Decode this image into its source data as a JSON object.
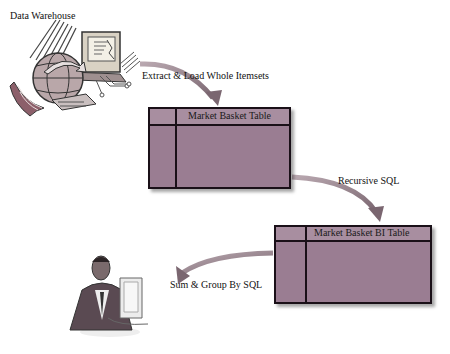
{
  "labels": {
    "data_warehouse": "Data Warehouse",
    "extract_load": "Extract & Load Whole Itemsets",
    "recursive_sql": "Recursive SQL",
    "sum_group": "Sum & Group By SQL"
  },
  "tables": [
    {
      "title": "Market Basket Table"
    },
    {
      "title": "Market Basket  BI Table"
    }
  ],
  "icons": {
    "warehouse": "data-warehouse-globe-computer-icon",
    "user": "business-user-at-computer-icon"
  },
  "colors": {
    "table_fill": "#9a7d92",
    "table_border": "#1a1018",
    "arrow": "#8a7a80"
  }
}
